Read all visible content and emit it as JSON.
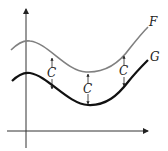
{
  "diagram": {
    "curves": [
      {
        "name": "F",
        "label": "F",
        "color": "#808080"
      },
      {
        "name": "G",
        "label": "G",
        "color": "#111111"
      }
    ],
    "offset_labels": [
      "C",
      "C",
      "C"
    ],
    "axes": {
      "x": "horizontal axis with arrow",
      "y": "vertical axis with arrow"
    }
  }
}
